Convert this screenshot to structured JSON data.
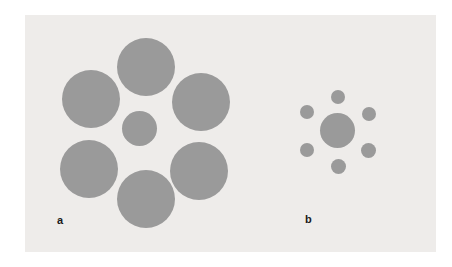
{
  "figure": {
    "background_color": "#ffffff",
    "panel_color": "#eeecea",
    "disc_color": "#9a9a9a",
    "label_color": "#1a1a1a",
    "canvas": {
      "width": 452,
      "height": 267
    },
    "panel_box": {
      "x": 25,
      "y": 15,
      "width": 411,
      "height": 237
    }
  },
  "panels": [
    {
      "id": "a",
      "label": "a",
      "label_position": {
        "x": 57,
        "y": 215
      },
      "description": "central disc surrounded by six large inducer discs",
      "center_disc": {
        "name": "center-disc-a",
        "cx": 139.5,
        "cy": 128.0,
        "diameter": 35
      },
      "surround_diameter": 58,
      "surround_count": 6,
      "surround_discs": [
        {
          "name": "surround-disc-a-top",
          "cx": 146.0,
          "cy": 67.0,
          "diameter": 58
        },
        {
          "name": "surround-disc-a-upper-left",
          "cx": 91.0,
          "cy": 99.0,
          "diameter": 58
        },
        {
          "name": "surround-disc-a-upper-right",
          "cx": 201.0,
          "cy": 102.0,
          "diameter": 58
        },
        {
          "name": "surround-disc-a-lower-left",
          "cx": 89.0,
          "cy": 169.0,
          "diameter": 58
        },
        {
          "name": "surround-disc-a-lower-right",
          "cx": 199.0,
          "cy": 171.0,
          "diameter": 58
        },
        {
          "name": "surround-disc-a-bottom",
          "cx": 146.0,
          "cy": 199.0,
          "diameter": 58
        }
      ]
    },
    {
      "id": "b",
      "label": "b",
      "label_position": {
        "x": 305,
        "y": 214
      },
      "description": "central disc of identical size surrounded by six small inducer discs",
      "center_disc": {
        "name": "center-disc-b",
        "cx": 337.5,
        "cy": 130.5,
        "diameter": 35
      },
      "surround_diameter": 14,
      "surround_count": 6,
      "surround_discs": [
        {
          "name": "surround-disc-b-top",
          "cx": 338.0,
          "cy": 97.0,
          "diameter": 14
        },
        {
          "name": "surround-disc-b-upper-left",
          "cx": 307.0,
          "cy": 112.0,
          "diameter": 14
        },
        {
          "name": "surround-disc-b-upper-right",
          "cx": 369.0,
          "cy": 114.0,
          "diameter": 14
        },
        {
          "name": "surround-disc-b-lower-left",
          "cx": 307.0,
          "cy": 150.0,
          "diameter": 14
        },
        {
          "name": "surround-disc-b-lower-right",
          "cx": 368.0,
          "cy": 150.0,
          "diameter": 15
        },
        {
          "name": "surround-disc-b-bottom",
          "cx": 338.0,
          "cy": 166.0,
          "diameter": 15
        }
      ]
    }
  ]
}
